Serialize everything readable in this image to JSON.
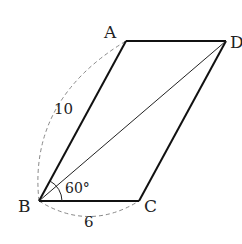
{
  "diagram": {
    "type": "parallelogram",
    "vertices": {
      "A": {
        "label": "A"
      },
      "B": {
        "label": "B"
      },
      "C": {
        "label": "C"
      },
      "D": {
        "label": "D"
      }
    },
    "measurements": {
      "AB": "10",
      "BC": "6",
      "angle_B": "60°"
    }
  }
}
